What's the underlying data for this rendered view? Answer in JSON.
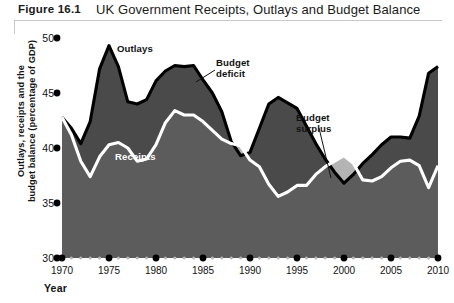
{
  "header": {
    "figure_label": "Figure 16.1",
    "title": "UK Government Receipts, Outlays and Budget Balance"
  },
  "axes": {
    "y_title_line1": "Outlays, receipts and the",
    "y_title_line2": "budget balance (percentage of GDP)",
    "x_title": "Year",
    "y_ticks": [
      "50",
      "45",
      "40",
      "35",
      "30"
    ],
    "x_ticks": [
      "1970",
      "1975",
      "1980",
      "1985",
      "1990",
      "1995",
      "2000",
      "2005",
      "2010"
    ]
  },
  "annotations": {
    "outlays": "Outlays",
    "receipts": "Receipts",
    "budget_deficit_line1": "Budget",
    "budget_deficit_line2": "deficit",
    "budget_surplus_line1": "Budget",
    "budget_surplus_line2": "surplus"
  },
  "colors": {
    "deficit_fill": "#4a4a4a",
    "receipts_fill": "#5c5c5c",
    "surplus_fill": "#b4b4b4",
    "outlays_line": "#000000",
    "receipts_line": "#ffffff",
    "tick_major": "#000000",
    "tick_minor": "#b9b9b9"
  },
  "chart_data": {
    "type": "area",
    "title": "UK Government Receipts, Outlays and Budget Balance",
    "xlabel": "Year",
    "ylabel": "Outlays, receipts and the budget balance (percentage of GDP)",
    "xlim": [
      1970,
      2010
    ],
    "ylim": [
      30,
      50
    ],
    "grid": false,
    "legend": "inline-annotations",
    "x": [
      1970,
      1971,
      1972,
      1973,
      1974,
      1975,
      1976,
      1977,
      1978,
      1979,
      1980,
      1981,
      1982,
      1983,
      1984,
      1985,
      1986,
      1987,
      1988,
      1989,
      1990,
      1991,
      1992,
      1993,
      1994,
      1995,
      1996,
      1997,
      1998,
      1999,
      2000,
      2001,
      2002,
      2003,
      2004,
      2005,
      2006,
      2007,
      2008,
      2009,
      2010
    ],
    "series": [
      {
        "name": "Outlays",
        "values": [
          42.8,
          41.8,
          40.4,
          42.4,
          47.2,
          49.3,
          47.4,
          44.2,
          44.0,
          44.4,
          46.1,
          47.0,
          47.5,
          47.4,
          47.5,
          46.2,
          45.0,
          43.3,
          40.6,
          39.3,
          39.6,
          41.8,
          44.0,
          44.6,
          44.1,
          43.6,
          42.0,
          40.4,
          39.0,
          37.8,
          36.8,
          37.6,
          38.6,
          39.4,
          40.3,
          41.0,
          41.0,
          40.9,
          42.9,
          46.8,
          47.4
        ]
      },
      {
        "name": "Receipts",
        "values": [
          42.8,
          41.2,
          38.8,
          37.4,
          39.2,
          40.3,
          40.5,
          40.0,
          38.8,
          39.0,
          40.3,
          42.3,
          43.4,
          43.0,
          43.0,
          42.4,
          41.6,
          40.8,
          40.4,
          40.2,
          38.9,
          38.3,
          36.7,
          35.6,
          36.0,
          36.6,
          36.6,
          37.6,
          38.3,
          38.8,
          39.3,
          38.6,
          37.1,
          37.0,
          37.4,
          38.2,
          38.8,
          38.9,
          38.4,
          36.4,
          38.4
        ]
      }
    ],
    "regions": [
      {
        "name": "Budget deficit",
        "fill": "#4a4a4a",
        "where": "outlays > receipts"
      },
      {
        "name": "Budget surplus",
        "fill": "#b4b4b4",
        "where": "receipts > outlays",
        "spans": [
          [
            1988.4,
            1990.3
          ],
          [
            1998.6,
            2001.2
          ]
        ]
      }
    ]
  }
}
